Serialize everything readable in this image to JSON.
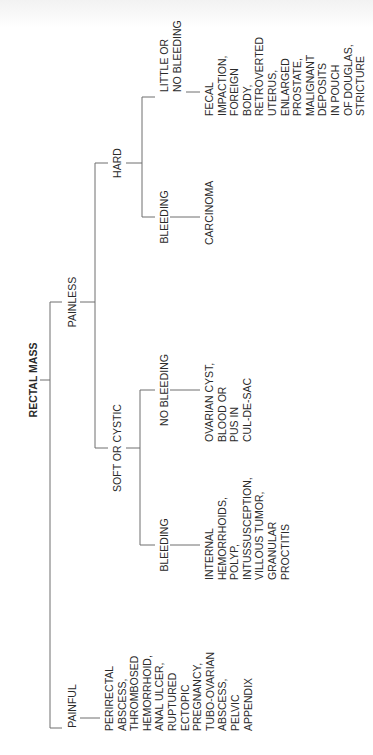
{
  "diagram": {
    "title": "RECTAL MASS",
    "orientation": "rotated -90deg (read bottom to top)",
    "line_color": "#6e6e6e",
    "text_color": "#2a2a2a",
    "root": {
      "label": "RECTAL MASS",
      "children": [
        {
          "label": "PAINLESS",
          "children": [
            {
              "label": "HARD",
              "children": [
                {
                  "label": "LITTLE OR NO BLEEDING",
                  "lines": [
                    "LITTLE OR",
                    "NO BLEEDING"
                  ],
                  "causes": [
                    "FECAL",
                    "IMPACTION,",
                    "FOREIGN",
                    "BODY,",
                    "RETROVERTED",
                    "UTERUS,",
                    "ENLARGED",
                    "PROSTATE,",
                    "MALIGNANT",
                    "DEPOSITS",
                    "IN POUCH",
                    "OF DOUGLAS,",
                    "STRICTURE"
                  ]
                },
                {
                  "label": "BLEEDING",
                  "causes": [
                    "CARCINOMA"
                  ]
                }
              ]
            },
            {
              "label": "SOFT OR CYSTIC",
              "children": [
                {
                  "label": "NO BLEEDING",
                  "causes": [
                    "OVARIAN CYST,",
                    "BLOOD OR",
                    "PUS IN",
                    "CUL-DE-SAC"
                  ]
                },
                {
                  "label": "BLEEDING",
                  "causes": [
                    "INTERNAL",
                    "HEMORRHOIDS,",
                    "POLYP,",
                    "INTUSSUSCEPTION,",
                    "VILLOUS TUMOR,",
                    "GRANULAR",
                    "PROCTITIS"
                  ]
                }
              ]
            }
          ]
        },
        {
          "label": "PAINFUL",
          "causes": [
            "PERIRECTAL",
            "ABSCESS,",
            "THROMBOSED",
            "HEMORRHOID,",
            "ANAL ULCER,",
            "RUPTURED",
            "ECTOPIC",
            "PREGNANCY,",
            "TUBO-OVARIAN",
            "ABSCESS,",
            "PELVIC",
            "APPENDIX"
          ]
        }
      ]
    }
  }
}
